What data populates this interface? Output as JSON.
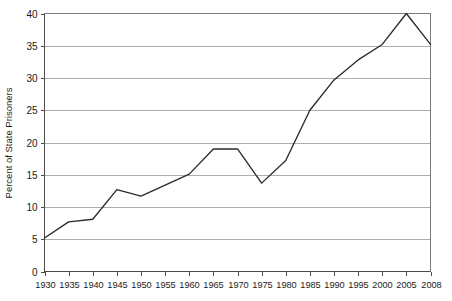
{
  "chart_data": {
    "type": "line",
    "title": "",
    "subtitle": "",
    "xlabel": "",
    "ylabel": "Percent of State Prisoners",
    "categories": [
      "1930",
      "1935",
      "1940",
      "1945",
      "1950",
      "1955",
      "1960",
      "1965",
      "1970",
      "1975",
      "1980",
      "1985",
      "1990",
      "1995",
      "2000",
      "2005",
      "2008"
    ],
    "x": [
      1930,
      1935,
      1940,
      1945,
      1950,
      1955,
      1960,
      1965,
      1970,
      1975,
      1980,
      1985,
      1990,
      1995,
      2000,
      2005,
      2008
    ],
    "values": [
      5.2,
      7.7,
      8.1,
      12.7,
      11.7,
      13.4,
      15.1,
      19.0,
      19.0,
      13.7,
      17.2,
      25.0,
      29.7,
      32.8,
      35.2,
      40.0,
      35.2
    ],
    "series": [
      {
        "name": "Percent of State Prisoners",
        "values": [
          5.2,
          7.7,
          8.1,
          12.7,
          11.7,
          13.4,
          15.1,
          19.0,
          19.0,
          13.7,
          17.2,
          25.0,
          29.7,
          32.8,
          35.2,
          40.0,
          35.2
        ]
      }
    ],
    "xlim": [
      1930,
      2008
    ],
    "ylim": [
      0,
      40
    ],
    "ytick_labels": [
      "0",
      "5",
      "10",
      "15",
      "20",
      "25",
      "30",
      "35",
      "40"
    ],
    "ytick_values": [
      0,
      5,
      10,
      15,
      20,
      25,
      30,
      35,
      40
    ],
    "xtick_labels": [
      "1930",
      "1935",
      "1940",
      "1945",
      "1950",
      "1955",
      "1960",
      "1965",
      "1970",
      "1975",
      "1980",
      "1985",
      "1990",
      "1995",
      "2000",
      "2005",
      "2008"
    ],
    "grid": true,
    "grid_axis": "y",
    "legend": false,
    "legend_position": "none",
    "line_color": "#2b2b2b",
    "grid_color": "#9a9a9a",
    "axis_color": "#4a4a4a",
    "background_color": "#ffffff",
    "annotations": []
  },
  "axis": {
    "ylabel": "Percent of State Prisoners"
  }
}
